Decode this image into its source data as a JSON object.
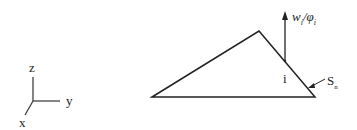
{
  "axes": {
    "z": "z",
    "y": "y",
    "x": "x"
  },
  "labels": {
    "arrow_label": "w",
    "arrow_sub": "i",
    "arrow_sep": "/φ",
    "arrow_sub2": "i",
    "node": "i",
    "surface": "S",
    "surface_sub": "n"
  },
  "colors": {
    "stroke": "#222222",
    "background": "#ffffff"
  }
}
